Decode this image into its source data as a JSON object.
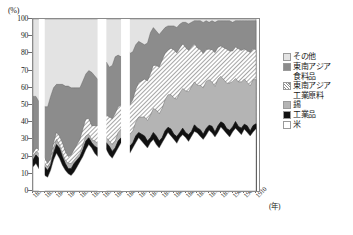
{
  "chart_data": {
    "type": "area",
    "title": "",
    "subtitle": "",
    "xlabel": "(年)",
    "ylabel": "(%)",
    "stacked": true,
    "normalized_percent": true,
    "grid": false,
    "legend_position": "right",
    "ylim": [
      0,
      100
    ],
    "ytick_labels": [
      "0",
      "10",
      "20",
      "30",
      "40",
      "50",
      "60",
      "70",
      "80",
      "90",
      "100"
    ],
    "ytick_values": [
      0,
      10,
      20,
      30,
      40,
      50,
      60,
      70,
      80,
      90,
      100
    ],
    "xlim": [
      1834,
      1911
    ],
    "xtick_labels": [
      "1834",
      "1838",
      "1842",
      "1846",
      "1850",
      "1854",
      "1858",
      "1862",
      "1866",
      "1870",
      "1874",
      "1878",
      "1882",
      "1886",
      "1890",
      "1894",
      "1898",
      "1902",
      "1906",
      "1910"
    ],
    "xtick_values": [
      1834,
      1838,
      1842,
      1846,
      1850,
      1854,
      1858,
      1862,
      1866,
      1870,
      1874,
      1878,
      1882,
      1886,
      1890,
      1894,
      1898,
      1902,
      1906,
      1910
    ],
    "series_order_bottom_to_top": [
      "米",
      "工業品",
      "錫",
      "東南アジア工業原料",
      "東南アジア食料品",
      "その他"
    ],
    "series": [
      {
        "name": "米",
        "fill": "#ffffff",
        "pattern": "solid",
        "values": [
          14,
          16,
          13,
          11,
          9,
          8,
          12,
          18,
          22,
          19,
          15,
          12,
          10,
          9,
          11,
          14,
          17,
          20,
          24,
          27,
          25,
          22,
          20,
          23,
          26,
          24,
          21,
          19,
          22,
          25,
          28,
          26,
          24,
          22,
          25,
          28,
          31,
          29,
          27,
          25,
          28,
          30,
          27,
          25,
          28,
          31,
          34,
          32,
          30,
          28,
          31,
          34,
          32,
          30,
          33,
          36,
          34,
          32,
          30,
          33,
          36,
          34,
          32,
          35,
          38,
          36,
          34,
          32,
          35,
          38,
          36,
          34,
          37,
          35,
          33,
          36,
          38
        ]
      },
      {
        "name": "工業品",
        "fill": "#111111",
        "pattern": "solid",
        "values": [
          4,
          5,
          6,
          7,
          5,
          4,
          3,
          4,
          5,
          6,
          5,
          4,
          3,
          4,
          5,
          4,
          3,
          4,
          5,
          4,
          3,
          4,
          5,
          4,
          3,
          4,
          5,
          4,
          3,
          4,
          3,
          4,
          5,
          4,
          3,
          4,
          3,
          4,
          5,
          4,
          3,
          4,
          5,
          4,
          3,
          4,
          3,
          4,
          3,
          4,
          3,
          4,
          3,
          4,
          3,
          4,
          3,
          4,
          3,
          4,
          3,
          4,
          3,
          4,
          3,
          4,
          3,
          4,
          3,
          4,
          3,
          4,
          3,
          4,
          3,
          4,
          3
        ]
      },
      {
        "name": "錫",
        "fill": "#b4b4b4",
        "pattern": "solid",
        "values": [
          2,
          2,
          3,
          3,
          2,
          2,
          2,
          3,
          3,
          2,
          2,
          2,
          3,
          3,
          2,
          2,
          2,
          3,
          3,
          2,
          2,
          3,
          3,
          2,
          2,
          3,
          3,
          4,
          4,
          5,
          5,
          6,
          6,
          7,
          7,
          8,
          9,
          10,
          11,
          12,
          13,
          14,
          15,
          16,
          17,
          18,
          19,
          20,
          21,
          22,
          23,
          24,
          25,
          26,
          27,
          26,
          25,
          26,
          27,
          28,
          27,
          26,
          27,
          28,
          27,
          26,
          27,
          28,
          27,
          26,
          27,
          28,
          27,
          26,
          27,
          28,
          27
        ]
      },
      {
        "name": "東南アジア工業原料",
        "fill": "#8f8f8f",
        "pattern": "diagonal-hatch",
        "values": [
          2,
          2,
          2,
          3,
          3,
          2,
          2,
          3,
          4,
          5,
          6,
          5,
          4,
          5,
          6,
          7,
          8,
          9,
          10,
          9,
          8,
          9,
          10,
          11,
          12,
          13,
          14,
          15,
          16,
          15,
          14,
          15,
          16,
          17,
          18,
          19,
          20,
          21,
          22,
          23,
          24,
          25,
          26,
          27,
          28,
          27,
          26,
          27,
          28,
          27,
          26,
          27,
          26,
          25,
          24,
          23,
          22,
          21,
          20,
          19,
          18,
          19,
          20,
          19,
          18,
          19,
          20,
          19,
          18,
          19,
          20,
          19,
          18,
          19,
          20,
          19,
          18
        ]
      },
      {
        "name": "東南アジア食料品",
        "fill": "#8c8c8c",
        "pattern": "solid",
        "values": [
          33,
          30,
          28,
          27,
          30,
          33,
          36,
          32,
          28,
          30,
          34,
          38,
          41,
          39,
          36,
          33,
          30,
          28,
          26,
          28,
          31,
          29,
          27,
          25,
          28,
          31,
          29,
          31,
          33,
          30,
          28,
          31,
          33,
          30,
          28,
          26,
          24,
          22,
          20,
          22,
          24,
          22,
          20,
          19,
          17,
          15,
          14,
          13,
          14,
          15,
          14,
          13,
          15,
          16,
          15,
          14,
          16,
          17,
          18,
          17,
          16,
          17,
          18,
          16,
          15,
          16,
          17,
          18,
          17,
          16,
          17,
          18,
          17,
          18,
          19,
          17,
          18
        ]
      },
      {
        "name": "その他",
        "fill": "#e3e3e3",
        "pattern": "solid",
        "values": [
          45,
          45,
          48,
          49,
          51,
          51,
          45,
          40,
          38,
          38,
          38,
          39,
          39,
          40,
          40,
          40,
          40,
          36,
          32,
          30,
          31,
          33,
          35,
          35,
          29,
          25,
          28,
          27,
          22,
          21,
          22,
          20,
          16,
          20,
          19,
          15,
          13,
          14,
          15,
          14,
          8,
          5,
          7,
          9,
          7,
          5,
          4,
          4,
          4,
          5,
          3,
          2,
          2,
          3,
          2,
          1,
          1,
          1,
          2,
          1,
          2,
          1,
          2,
          1,
          1,
          1,
          1,
          1,
          2,
          1,
          1,
          1,
          1,
          1,
          1,
          1,
          1
        ]
      }
    ],
    "data_gaps_years": [
      [
        1836,
        1838
      ],
      [
        1856,
        1859
      ],
      [
        1864,
        1867
      ]
    ],
    "legend_entries": [
      {
        "label": "その他",
        "swatch": "sw-other"
      },
      {
        "label": "東南アジア",
        "label_cont": "食料品",
        "swatch": "sw-food"
      },
      {
        "label": "東南アジア",
        "label_cont": "工業原料",
        "swatch": "sw-raw"
      },
      {
        "label": "錫",
        "swatch": "sw-tin"
      },
      {
        "label": "工業品",
        "swatch": "sw-ind"
      },
      {
        "label": "米",
        "swatch": "sw-rice"
      }
    ]
  }
}
